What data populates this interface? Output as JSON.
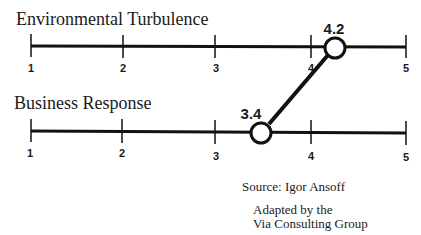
{
  "diagram": {
    "scales": [
      {
        "title": "Environmental Turbulence",
        "ticks": [
          "1",
          "2",
          "3",
          "4",
          "5"
        ],
        "value": 4.2,
        "value_label": "4.2"
      },
      {
        "title": "Business Response",
        "ticks": [
          "1",
          "2",
          "3",
          "4",
          "5"
        ],
        "value": 3.4,
        "value_label": "3.4"
      }
    ],
    "source": "Source:  Igor Ansoff",
    "adapted_line1": "Adapted by the",
    "adapted_line2": "Via Consulting Group"
  },
  "colors": {
    "line": "#111111",
    "background": "#ffffff"
  }
}
